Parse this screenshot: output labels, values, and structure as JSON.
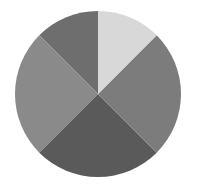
{
  "chart_data": {
    "type": "pie",
    "title": "",
    "legend": [],
    "labels": [
      "Slice A",
      "Slice B",
      "Slice C",
      "Slice D",
      "Slice E"
    ],
    "values": [
      12.5,
      25,
      25,
      25,
      12.5
    ],
    "colors": [
      "#6e6e6e",
      "#8a8a8a",
      "#5a5a5a",
      "#7c7c7c",
      "#d8d8d8"
    ],
    "start_angle_deg": 90,
    "direction": "counterclockwise",
    "center": [
      98,
      94
    ],
    "radius": 83,
    "has_labels": false,
    "has_legend": false
  }
}
